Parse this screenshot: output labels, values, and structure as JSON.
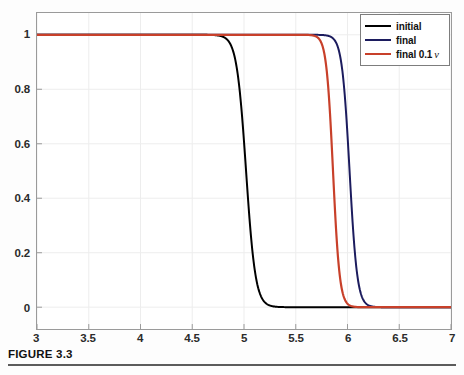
{
  "figure": {
    "caption": "FIGURE 3.3"
  },
  "chart_data": {
    "type": "line",
    "title": "",
    "xlabel": "",
    "ylabel": "",
    "xlim": [
      3,
      7
    ],
    "ylim": [
      -0.08,
      1.08
    ],
    "grid": true,
    "background": "#ffffff",
    "axis_color": "#9a9a9a",
    "grid_color": "#ededed",
    "xticks": [
      3,
      3.5,
      4,
      4.5,
      5,
      5.5,
      6,
      6.5,
      7
    ],
    "xtick_labels": [
      "3",
      "3.5",
      "4",
      "4.5",
      "5",
      "5.5",
      "6",
      "6.5",
      "7"
    ],
    "yticks": [
      0,
      0.2,
      0.4,
      0.6,
      0.8,
      1
    ],
    "ytick_labels": [
      "0",
      "0.2",
      "0.4",
      "0.6",
      "0.8",
      "1"
    ],
    "legend": {
      "position": "top-right",
      "entries": [
        {
          "label": "initial",
          "color": "#000000",
          "nu": ""
        },
        {
          "label": "final",
          "color": "#1c1c5e",
          "nu": ""
        },
        {
          "label": "final 0.1",
          "color": "#c8402a",
          "nu": "ν"
        }
      ]
    },
    "series": [
      {
        "name": "initial",
        "color": "#000000",
        "width": 2.0,
        "shape": "tanh-drop",
        "center": 5.02,
        "steepness": 11.0,
        "low": 0.0,
        "high": 1.0
      },
      {
        "name": "final",
        "color": "#1c1c5e",
        "width": 2.0,
        "shape": "tanh-drop",
        "center": 6.02,
        "steepness": 13.5,
        "low": 0.0,
        "high": 1.0
      },
      {
        "name": "final 0.1 ν",
        "color": "#c8402a",
        "width": 2.2,
        "shape": "tanh-drop",
        "center": 5.86,
        "steepness": 15.5,
        "low": 0.0,
        "high": 1.0
      }
    ],
    "annotations": [
      "All three curves start near y = 1 on the left and fall to y = 0 on the right.",
      "black 'initial' transitions at x ≈ 5.0",
      "red 'final 0.1 nu' transitions at x ≈ 5.86",
      "blue 'final' transitions at x ≈ 6.02"
    ]
  }
}
